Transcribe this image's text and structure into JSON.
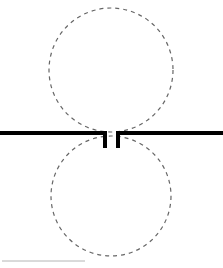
{
  "figure": {
    "name": "feynman-diagram-double-loop-self-energy",
    "width": 223,
    "height": 268,
    "background_color": "#ffffff",
    "caption": ""
  },
  "chart_data": {
    "type": "diagram",
    "title": "",
    "xlabel": "",
    "ylabel": "",
    "xlim": [
      0,
      223
    ],
    "ylim": [
      0,
      268
    ],
    "grid": false,
    "legend": "none",
    "elements": [
      {
        "name": "fermion-line-left",
        "kind": "line",
        "style": "solid",
        "color": "#000000",
        "linewidth": 4.0,
        "x": [
          0,
          107
        ],
        "y": [
          133,
          133
        ]
      },
      {
        "name": "fermion-line-right",
        "kind": "line",
        "style": "solid",
        "color": "#000000",
        "linewidth": 4.0,
        "x": [
          116,
          223
        ],
        "y": [
          133,
          133
        ]
      },
      {
        "name": "vertex-stub-left",
        "kind": "line",
        "style": "solid",
        "color": "#000000",
        "linewidth": 4.0,
        "x": [
          105,
          105
        ],
        "y": [
          133,
          148
        ]
      },
      {
        "name": "vertex-stub-right",
        "kind": "line",
        "style": "solid",
        "color": "#000000",
        "linewidth": 4.0,
        "x": [
          118,
          118
        ],
        "y": [
          133,
          148
        ]
      },
      {
        "name": "upper-loop",
        "kind": "circle",
        "style": "dashed",
        "color": "#666666",
        "linewidth": 1.2,
        "dash": [
          4,
          4
        ],
        "cx": 111,
        "cy": 70,
        "r": 62
      },
      {
        "name": "lower-loop",
        "kind": "circle",
        "style": "dashed",
        "color": "#666666",
        "linewidth": 1.2,
        "dash": [
          4,
          4
        ],
        "cx": 111,
        "cy": 196,
        "r": 60
      },
      {
        "name": "baseline-rule",
        "kind": "line",
        "style": "solid",
        "color": "#b4b4b4",
        "linewidth": 1.0,
        "x": [
          2,
          85
        ],
        "y": [
          261,
          261
        ]
      }
    ]
  }
}
